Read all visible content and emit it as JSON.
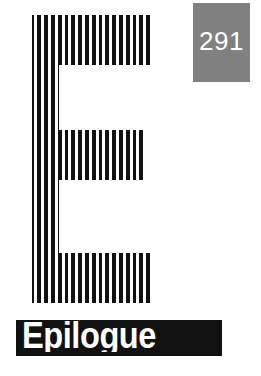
{
  "page": {
    "width": 261,
    "height": 376,
    "background_color": "#ffffff"
  },
  "page_number": {
    "value": "291",
    "box_color": "#808080",
    "text_color": "#ffffff"
  },
  "chapter_title": {
    "text": "Epilogue",
    "bar_color": "#111111",
    "text_color": "#ffffff"
  },
  "artwork": {
    "name": "striped-letter-e",
    "letter": "E",
    "ink_color": "#111111",
    "stripe_color": "#ffffff",
    "stripe_count": 22,
    "stripe_pitch_px": 6.8,
    "stripe_width_px": 3
  }
}
